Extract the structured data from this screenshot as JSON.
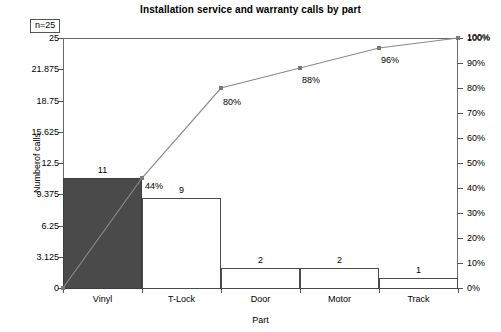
{
  "chart_data": {
    "type": "bar",
    "title": "Installation service and warranty calls by part",
    "xlabel": "Part",
    "ylabel": "Numberof calls",
    "categories": [
      "Vinyl",
      "T-Lock",
      "Door",
      "Motor",
      "Track"
    ],
    "values": [
      11,
      9,
      2,
      2,
      1
    ],
    "value_labels": [
      "11",
      "9",
      "2",
      "2",
      "1"
    ],
    "cumulative_percent": [
      44,
      80,
      88,
      96,
      100
    ],
    "cumulative_labels": [
      "44%",
      "80%",
      "88%",
      "96%",
      "100%"
    ],
    "ylim": [
      0,
      25
    ],
    "y_ticks": [
      0,
      3.125,
      6.25,
      9.375,
      12.5,
      15.625,
      18.75,
      21.875,
      25
    ],
    "y_tick_labels": [
      "0",
      "3.125",
      "6.25",
      "9.375",
      "12.5",
      "15.625",
      "18.75",
      "21.875",
      "25"
    ],
    "y2lim": [
      0,
      100
    ],
    "y2_label_suffix": "%",
    "y2_ticks": [
      0,
      10,
      20,
      30,
      40,
      50,
      60,
      70,
      80,
      90,
      100
    ],
    "y2_tick_labels": [
      "0%",
      "10%",
      "20%",
      "30%",
      "40%",
      "50%",
      "60%",
      "70%",
      "80%",
      "90%",
      "100%"
    ],
    "grid": false,
    "legend": "none",
    "annotation_n": "n=25",
    "bar_fill_colors": [
      "#4a4a4a",
      "#ffffff",
      "#ffffff",
      "#ffffff",
      "#ffffff"
    ],
    "bar_border_color": "#4a4a4a",
    "line_color": "#8a8a8a",
    "marker_color": "#7a7a7a",
    "axis_color": "#6a6a6a"
  }
}
